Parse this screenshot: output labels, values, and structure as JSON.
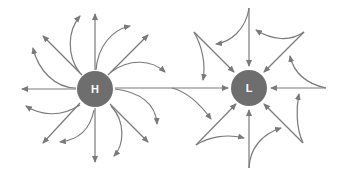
{
  "diagram": {
    "colors": {
      "center_fill": "#6e6e6e",
      "arrow": "#7a7a7a",
      "label": "#ffffff",
      "background": "#ffffff"
    },
    "high": {
      "label": "H",
      "meaning": "High pressure - air diverges outward",
      "cx": 95,
      "cy": 89,
      "r": 18
    },
    "low": {
      "label": "L",
      "meaning": "Low pressure - air converges inward",
      "cx": 249,
      "cy": 88,
      "r": 18
    }
  }
}
